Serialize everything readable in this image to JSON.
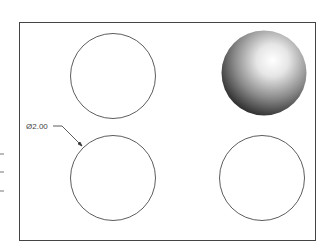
{
  "drawing": {
    "dimension_label": "Ø2.00",
    "colors": {
      "line": "#333333",
      "frame": "#444444",
      "sphere_highlight": "#ffffff",
      "sphere_shadow": "#111111"
    }
  }
}
